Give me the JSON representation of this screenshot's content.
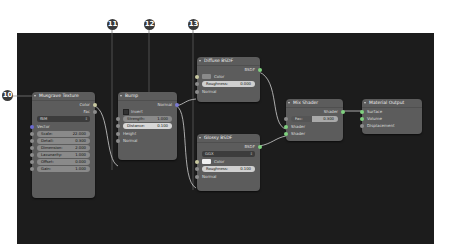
{
  "callouts": [
    {
      "label": "10",
      "target": "musgrave-texture-node"
    },
    {
      "label": "11",
      "target": "bump-height-input"
    },
    {
      "label": "12",
      "target": "bump-node"
    },
    {
      "label": "13",
      "target": "diffuse-glossy-normal-wire"
    }
  ],
  "nodes": {
    "musgrave": {
      "title": "Musgrave Texture",
      "outputs": [
        "Color",
        "Fac"
      ],
      "type_dropdown": "fBM",
      "vector_label": "Vector",
      "fields": [
        {
          "label": "Scale:",
          "value": "22.000"
        },
        {
          "label": "Detail:",
          "value": "0.300"
        },
        {
          "label": "Dimension:",
          "value": "2.000"
        },
        {
          "label": "Lacunarity:",
          "value": "1.000"
        },
        {
          "label": "Offset:",
          "value": "0.000"
        },
        {
          "label": "Gain:",
          "value": "1.000"
        }
      ]
    },
    "bump": {
      "title": "Bump",
      "output": "Normal",
      "invert_label": "Invert",
      "fields": [
        {
          "label": "Strength:",
          "value": "1.000"
        },
        {
          "label": "Distance:",
          "value": "0.100"
        }
      ],
      "inputs": [
        "Height",
        "Normal"
      ]
    },
    "diffuse": {
      "title": "Diffuse BSDF",
      "output": "BSDF",
      "color_label": "Color",
      "color_swatch": "#8a8a8a",
      "roughness": {
        "label": "Roughness:",
        "value": "0.000"
      },
      "normal_label": "Normal"
    },
    "glossy": {
      "title": "Glossy BSDF",
      "output": "BSDF",
      "distribution": "GGX",
      "color_label": "Color",
      "color_swatch": "#f0f0f0",
      "roughness": {
        "label": "Roughness:",
        "value": "0.100"
      },
      "normal_label": "Normal"
    },
    "mix": {
      "title": "Mix Shader",
      "output": "Shader",
      "fac": {
        "label": "Fac:",
        "value": "0.300"
      },
      "inputs": [
        "Shader",
        "Shader"
      ]
    },
    "output": {
      "title": "Material Output",
      "inputs": [
        "Surface",
        "Volume",
        "Displacement"
      ]
    }
  }
}
